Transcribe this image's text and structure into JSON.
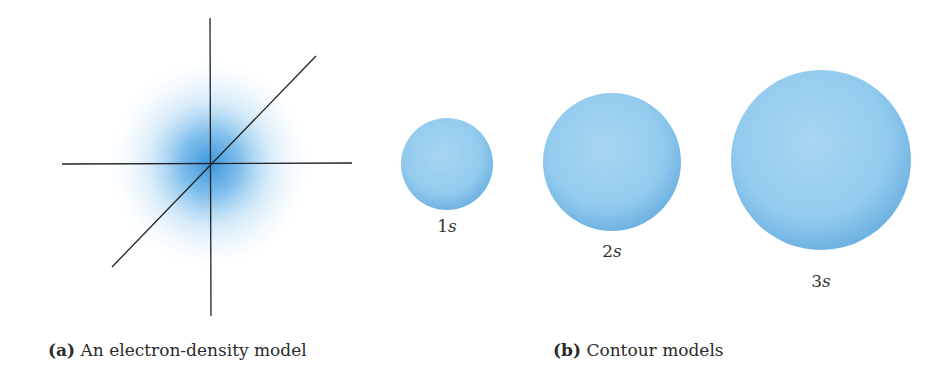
{
  "panel_a": {
    "tag": "(a)",
    "caption": "An electron-density model",
    "origin": {
      "x": 210,
      "y": 164
    },
    "axes": {
      "vertical": {
        "x1": 210,
        "y1": 18,
        "x2": 211,
        "y2": 316
      },
      "horizontal": {
        "x1": 62,
        "y1": 164,
        "x2": 352,
        "y2": 163
      },
      "diagonal": {
        "x1": 112,
        "y1": 267,
        "x2": 316,
        "y2": 56
      }
    },
    "cloud_color": "#3a9be0"
  },
  "panel_b": {
    "tag": "(b)",
    "caption": "Contour models",
    "sphere_color": "#8fcbee",
    "orbitals": [
      {
        "n": "1",
        "l": "s",
        "cx": 447,
        "cy": 164,
        "r": 46,
        "label_y": 228
      },
      {
        "n": "2",
        "l": "s",
        "cx": 612,
        "cy": 162,
        "r": 69,
        "label_y": 253
      },
      {
        "n": "3",
        "l": "s",
        "cx": 821,
        "cy": 160,
        "r": 90,
        "label_y": 283
      }
    ]
  }
}
